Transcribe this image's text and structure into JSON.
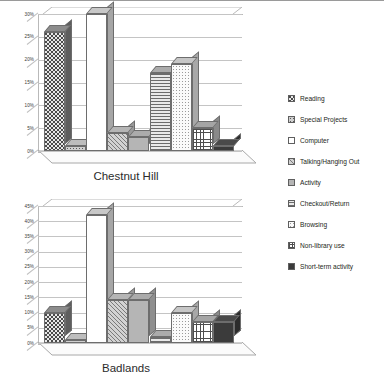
{
  "legend": {
    "position": "right",
    "items": [
      {
        "label": "Reading",
        "pattern": "checkerboard"
      },
      {
        "label": "Special Projects",
        "pattern": "dot-grid"
      },
      {
        "label": "Computer",
        "pattern": "white"
      },
      {
        "label": "Talking/Hanging Out",
        "pattern": "diagonal-hatch"
      },
      {
        "label": "Activity",
        "pattern": "solid-gray"
      },
      {
        "label": "Checkout/Return",
        "pattern": "horizontal-lines"
      },
      {
        "label": "Browsing",
        "pattern": "light-dots"
      },
      {
        "label": "Non-library use",
        "pattern": "grid"
      },
      {
        "label": "Short-term activity",
        "pattern": "dark-solid"
      }
    ]
  },
  "chart_data": [
    {
      "type": "bar",
      "title": "Chestnut Hill",
      "xlabel": "",
      "ylabel": "",
      "ylim": [
        0,
        30
      ],
      "ytick_labels": [
        "30%",
        "25%",
        "20%",
        "15%",
        "10%",
        "5%",
        "0%"
      ],
      "ytick_values": [
        30,
        25,
        20,
        15,
        10,
        5,
        0
      ],
      "grid": true,
      "categories": [
        "Reading",
        "Special Projects",
        "Computer",
        "Talking/Hanging Out",
        "Activity",
        "Checkout/Return",
        "Browsing",
        "Non-library use",
        "Short-term activity"
      ],
      "values": [
        26,
        1,
        30,
        4,
        3,
        17,
        19,
        5,
        1
      ]
    },
    {
      "type": "bar",
      "title": "Badlands",
      "xlabel": "",
      "ylabel": "",
      "ylim": [
        0,
        45
      ],
      "ytick_labels": [
        "45%",
        "40%",
        "35%",
        "30%",
        "25%",
        "20%",
        "15%",
        "10%",
        "5%",
        "0%"
      ],
      "ytick_values": [
        45,
        40,
        35,
        30,
        25,
        20,
        15,
        10,
        5,
        0
      ],
      "grid": true,
      "categories": [
        "Reading",
        "Special Projects",
        "Computer",
        "Talking/Hanging Out",
        "Activity",
        "Checkout/Return",
        "Browsing",
        "Non-library use",
        "Short-term activity"
      ],
      "values": [
        10,
        1,
        42,
        14,
        14,
        2,
        10,
        7,
        7
      ]
    }
  ]
}
